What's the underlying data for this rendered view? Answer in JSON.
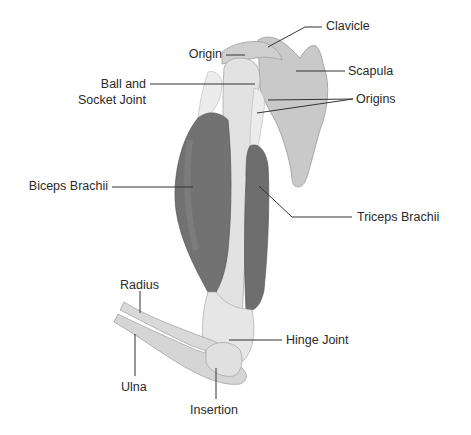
{
  "diagram": {
    "type": "anatomical-labeled-illustration",
    "colors": {
      "bone": "#dcdcdc",
      "bone_dark": "#c8c8c8",
      "scapula": "#c6c6c6",
      "muscle": "#6f6f6f",
      "muscle_light": "#8a8a8a",
      "leader_line": "#333333",
      "text": "#2a2a2a"
    },
    "labels": {
      "clavicle": "Clavicle",
      "origin": "Origin",
      "scapula": "Scapula",
      "ball_socket_1": "Ball and",
      "ball_socket_2": "Socket Joint",
      "origins": "Origins",
      "biceps": "Biceps Brachii",
      "triceps": "Triceps Brachii",
      "radius": "Radius",
      "ulna": "Ulna",
      "hinge": "Hinge Joint",
      "insertion": "Insertion"
    }
  }
}
